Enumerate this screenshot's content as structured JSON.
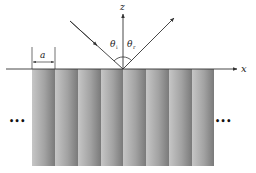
{
  "diagram": {
    "type": "grating-reflection-schematic",
    "axes": {
      "x_label": "x",
      "z_label": "z"
    },
    "angles": {
      "incident_symbol": "θ",
      "incident_subscript": "i",
      "reflected_symbol": "θ",
      "reflected_subscript": "r"
    },
    "period_label": "a",
    "stripe_count": 8,
    "continuation_left": "•••",
    "continuation_right": "•••",
    "colors": {
      "stripe_light": "#c4c4c4",
      "stripe_dark": "#7d7d7d",
      "line": "#333333"
    }
  }
}
